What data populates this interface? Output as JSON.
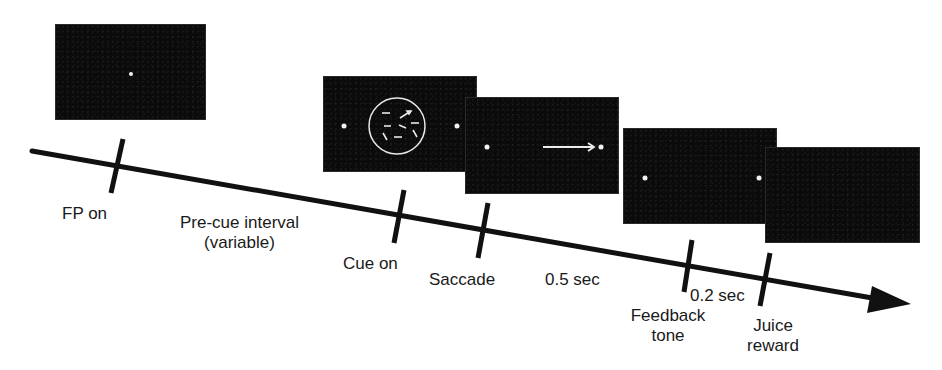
{
  "diagram": {
    "type": "task-timeline",
    "background": "#ffffff",
    "panel_color": "#0b0b0b",
    "stimulus_color": "#f2f2f2",
    "line_color": "#111111",
    "events": [
      {
        "id": "fp-on",
        "label": "FP on"
      },
      {
        "id": "cue-on",
        "label": "Cue on"
      },
      {
        "id": "saccade",
        "label": "Saccade"
      },
      {
        "id": "feedback-tone",
        "label_line1": "Feedback",
        "label_line2": "tone"
      },
      {
        "id": "juice-reward",
        "label_line1": "Juice",
        "label_line2": "reward"
      }
    ],
    "intervals": [
      {
        "id": "pre-cue",
        "label_line1": "Pre-cue interval",
        "label_line2": "(variable)"
      },
      {
        "id": "post-saccade",
        "label": "0.5 sec"
      },
      {
        "id": "feedback-to-juice",
        "label": "0.2 sec"
      }
    ],
    "panels": [
      {
        "id": "fixation-panel",
        "content": "central fixation point"
      },
      {
        "id": "cue-panel",
        "content": "two targets + circular aperture with moving dots"
      },
      {
        "id": "saccade-panel",
        "content": "fixation point + arrow to right target"
      },
      {
        "id": "feedback-panel",
        "content": "two targets"
      },
      {
        "id": "reward-panel",
        "content": "blank screen"
      }
    ]
  }
}
